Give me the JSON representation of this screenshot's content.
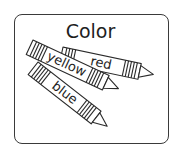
{
  "card": {
    "title": "Color",
    "border_color": "#3a3a3a",
    "background": "#ffffff"
  },
  "crayons": [
    {
      "label": "red",
      "icon": "crayon-icon"
    },
    {
      "label": "yellow",
      "icon": "crayon-icon"
    },
    {
      "label": "blue",
      "icon": "crayon-icon"
    }
  ]
}
